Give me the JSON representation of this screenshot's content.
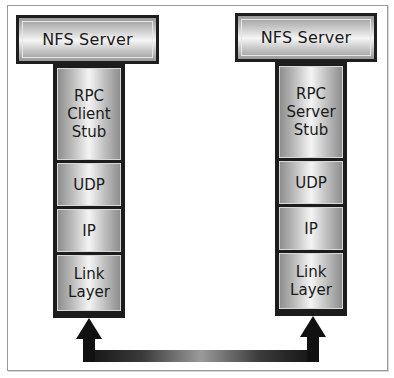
{
  "diagram": {
    "left": {
      "top_label": "NFS Server",
      "layers": [
        "RPC Client Stub",
        "UDP",
        "IP",
        "Link Layer"
      ],
      "layer_lines": [
        [
          "RPC",
          "Client",
          "Stub"
        ],
        [
          "UDP"
        ],
        [
          "IP"
        ],
        [
          "Link",
          "Layer"
        ]
      ]
    },
    "right": {
      "top_label": "NFS Server",
      "layers": [
        "RPC Server Stub",
        "UDP",
        "IP",
        "Link Layer"
      ],
      "layer_lines": [
        [
          "RPC",
          "Server",
          "Stub"
        ],
        [
          "UDP"
        ],
        [
          "IP"
        ],
        [
          "Link",
          "Layer"
        ]
      ]
    },
    "connector": "bidirectional-arrow-link-layers",
    "colors": {
      "border": "#1c1c1c",
      "arrow": "#111111",
      "frame": "#9a9a9a"
    }
  }
}
